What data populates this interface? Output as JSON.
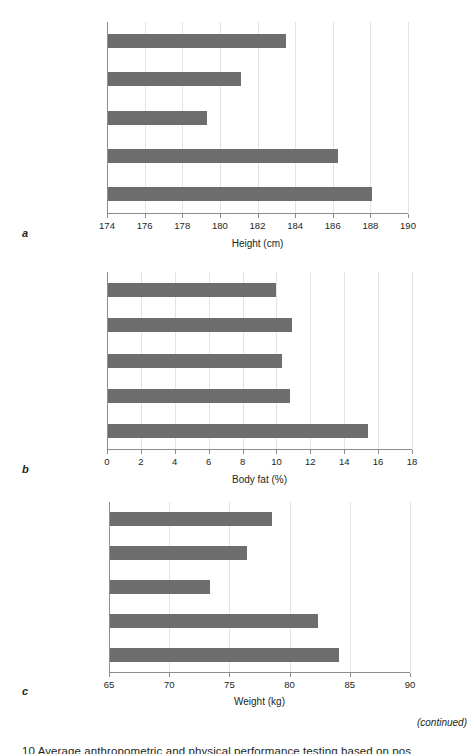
{
  "figure": {
    "continued_note": "(continued)",
    "caption_partial": "10   Average anthropometric and physical performance testing based on pos",
    "bar_color": "#6d6d6d",
    "grid_color": "#e3e3e3",
    "axis_color": "#8c8c8c"
  },
  "panels": [
    {
      "letter": "a",
      "axis_title": "Height (cm)",
      "categories": [
        "Forward",
        "Midfielder",
        "External defender",
        "Central defender",
        "Goalkeeper"
      ],
      "tick_labels": [
        "174",
        "176",
        "178",
        "180",
        "182",
        "184",
        "186",
        "188",
        "190"
      ]
    },
    {
      "letter": "b",
      "axis_title": "Body fat (%)",
      "categories": [
        "Forward",
        "Midfielder",
        "External defender",
        "Central defender",
        "Goalkeeper"
      ],
      "tick_labels": [
        "0",
        "2",
        "4",
        "6",
        "8",
        "10",
        "12",
        "14",
        "16",
        "18"
      ]
    },
    {
      "letter": "c",
      "axis_title": "Weight (kg)",
      "categories": [
        "Forward",
        "Midfielder",
        "External defender",
        "Central defender",
        "Goalkeeper"
      ],
      "tick_labels": [
        "65",
        "70",
        "75",
        "80",
        "85",
        "90"
      ]
    }
  ],
  "chart_data": [
    {
      "type": "bar",
      "orientation": "horizontal",
      "title": "",
      "panel": "a",
      "xlabel": "Height (cm)",
      "ylabel": "",
      "categories": [
        "Forward",
        "Midfielder",
        "External defender",
        "Central defender",
        "Goalkeeper"
      ],
      "values": [
        183.5,
        181.1,
        179.3,
        186.3,
        188.1
      ],
      "xlim": [
        174,
        190
      ],
      "xticks": [
        174,
        176,
        178,
        180,
        182,
        184,
        186,
        188,
        190
      ],
      "grid": "vertical",
      "legend": "none"
    },
    {
      "type": "bar",
      "orientation": "horizontal",
      "title": "",
      "panel": "b",
      "xlabel": "Body fat (%)",
      "ylabel": "",
      "categories": [
        "Forward",
        "Midfielder",
        "External defender",
        "Central defender",
        "Goalkeeper"
      ],
      "values": [
        10.0,
        10.9,
        10.3,
        10.8,
        15.4
      ],
      "xlim": [
        0,
        18
      ],
      "xticks": [
        0,
        2,
        4,
        6,
        8,
        10,
        12,
        14,
        16,
        18
      ],
      "grid": "vertical",
      "legend": "none"
    },
    {
      "type": "bar",
      "orientation": "horizontal",
      "title": "",
      "panel": "c",
      "xlabel": "Weight (kg)",
      "ylabel": "",
      "categories": [
        "Forward",
        "Midfielder",
        "External defender",
        "Central defender",
        "Goalkeeper"
      ],
      "values": [
        78.5,
        76.5,
        73.4,
        82.4,
        84.1
      ],
      "xlim": [
        65,
        90
      ],
      "xticks": [
        65,
        70,
        75,
        80,
        85,
        90
      ],
      "grid": "vertical",
      "legend": "none"
    }
  ]
}
